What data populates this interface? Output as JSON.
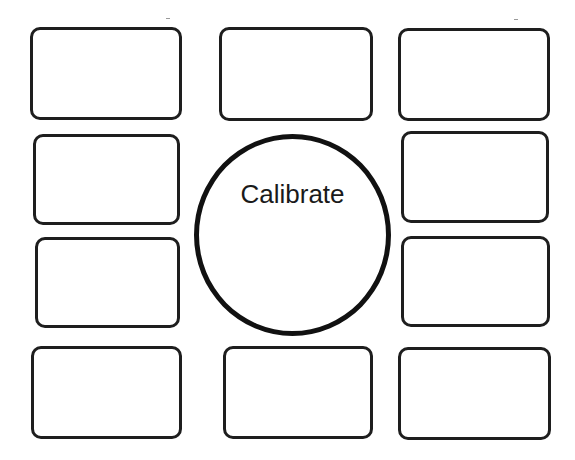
{
  "calibration_screen": {
    "center_button": {
      "label": "Calibrate",
      "shape": "circle"
    },
    "slots": [
      {
        "id": "top-left",
        "label": ""
      },
      {
        "id": "top-center",
        "label": ""
      },
      {
        "id": "top-right",
        "label": ""
      },
      {
        "id": "upper-left",
        "label": ""
      },
      {
        "id": "upper-right",
        "label": ""
      },
      {
        "id": "lower-left",
        "label": ""
      },
      {
        "id": "lower-right",
        "label": ""
      },
      {
        "id": "bottom-left",
        "label": ""
      },
      {
        "id": "bottom-center",
        "label": ""
      },
      {
        "id": "bottom-right",
        "label": ""
      }
    ]
  },
  "colors": {
    "background": "#ffffff",
    "outline": "#1e1e1e",
    "text": "#1a1a1a"
  }
}
